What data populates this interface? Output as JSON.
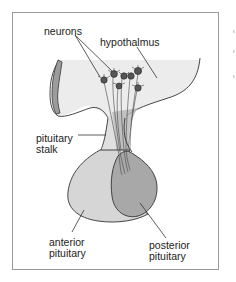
{
  "diagram": {
    "type": "anatomical-illustration",
    "labels": {
      "neurons": "neurons",
      "hypothalamus": "hypothalmus",
      "stalk_line1": "pituitary",
      "stalk_line2": "stalk",
      "anterior_line1": "anterior",
      "anterior_line2": "pituitary",
      "posterior_line1": "posterior",
      "posterior_line2": "pituitary"
    },
    "colors": {
      "frame_border": "#9a9a9a",
      "hypothalamus_fill": "#ececec",
      "left_edge_fill": "#9c9c9c",
      "anterior_fill": "#d6d6d6",
      "posterior_fill": "#a8a8a8",
      "outline": "#333333",
      "text": "#222222"
    }
  }
}
